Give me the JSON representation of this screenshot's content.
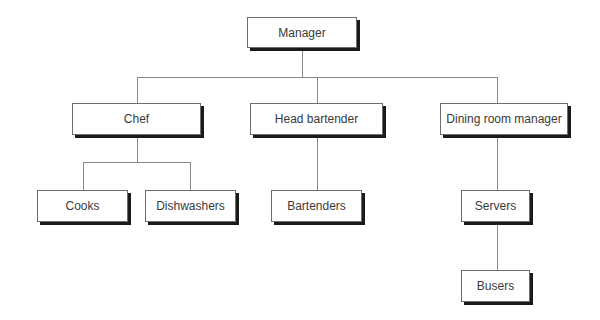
{
  "diagram": {
    "type": "org-chart",
    "nodes": {
      "manager": {
        "label": "Manager"
      },
      "chef": {
        "label": "Chef"
      },
      "head_bartender": {
        "label": "Head bartender"
      },
      "dining_room_manager": {
        "label": "Dining room manager"
      },
      "cooks": {
        "label": "Cooks"
      },
      "dishwashers": {
        "label": "Dishwashers"
      },
      "bartenders": {
        "label": "Bartenders"
      },
      "servers": {
        "label": "Servers"
      },
      "busers": {
        "label": "Busers"
      }
    },
    "edges": [
      {
        "from": "Manager",
        "to": "Chef"
      },
      {
        "from": "Manager",
        "to": "Head bartender"
      },
      {
        "from": "Manager",
        "to": "Dining room manager"
      },
      {
        "from": "Chef",
        "to": "Cooks"
      },
      {
        "from": "Chef",
        "to": "Dishwashers"
      },
      {
        "from": "Head bartender",
        "to": "Bartenders"
      },
      {
        "from": "Dining room manager",
        "to": "Servers"
      },
      {
        "from": "Servers",
        "to": "Busers"
      }
    ],
    "colors": {
      "box_border": "#6e6e6e",
      "box_shadow": "#1a1a1a",
      "connector": "#8a8a8a",
      "text": "#3a3a3a",
      "background": "#ffffff"
    }
  }
}
